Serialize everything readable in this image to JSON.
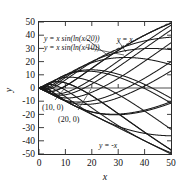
{
  "chart_data": {
    "type": "line",
    "title": "",
    "xlabel": "x",
    "ylabel": "y",
    "xlim": [
      0,
      50
    ],
    "ylim": [
      -50,
      50
    ],
    "grid": false,
    "legend_position": "inside-upper-left",
    "x_ticks": [
      "0",
      "10",
      "20",
      "30",
      "40",
      "50"
    ],
    "x_tick_values": [
      0,
      10,
      20,
      30,
      40,
      50
    ],
    "y_ticks": [
      "50",
      "40",
      "30",
      "20",
      "10",
      "0",
      "-10",
      "-20",
      "-30",
      "-40",
      "-50"
    ],
    "y_tick_values": [
      50,
      40,
      30,
      20,
      10,
      0,
      -10,
      -20,
      -30,
      -40,
      -50
    ],
    "annotations": [
      {
        "name": "label-curve-c20",
        "text": "y = x sin(ln(x/20))",
        "x": 4.5,
        "y": 40
      },
      {
        "name": "label-curve-c10",
        "text": "y = x sin(ln(x/10))",
        "x": 4.5,
        "y": 31
      },
      {
        "name": "label-upper-envelope",
        "text": "y = x",
        "x": 29.5,
        "y": 40
      },
      {
        "name": "label-lower-envelope",
        "text": "y = -x",
        "x": 28.0,
        "y": -42
      },
      {
        "name": "label-root-10",
        "text": "(10, 0)",
        "x": 2.0,
        "y": -15.5
      },
      {
        "name": "label-root-20",
        "text": "(20, 0)",
        "x": 8.5,
        "y": -22.5
      }
    ],
    "series": [
      {
        "name": "y = x",
        "style": "dashed",
        "formula": "x",
        "note": "upper envelope"
      },
      {
        "name": "y = -x",
        "style": "solid",
        "formula": "-x",
        "note": "lower envelope"
      },
      {
        "name": "y = x sin(ln(x/10))",
        "style": "solid",
        "formula": "x*sin(ln(x/10))",
        "zero_crossing": 10
      },
      {
        "name": "y = x sin(ln(x/20))",
        "style": "solid",
        "formula": "x*sin(ln(x/20))",
        "zero_crossing": 20
      },
      {
        "name": "family",
        "style": "solid",
        "formula": "x*sin(ln(x/c))",
        "note": "family of solutions for varying c, all bounded by y = x and y = -x"
      }
    ],
    "family_constants": [
      0.0012,
      0.0032,
      0.0075,
      0.016,
      0.032,
      0.062,
      0.115,
      0.21,
      0.37,
      0.64,
      1.1,
      1.85,
      3.1,
      5.2,
      8.6,
      14.2,
      23.5,
      38.5,
      63
    ]
  }
}
